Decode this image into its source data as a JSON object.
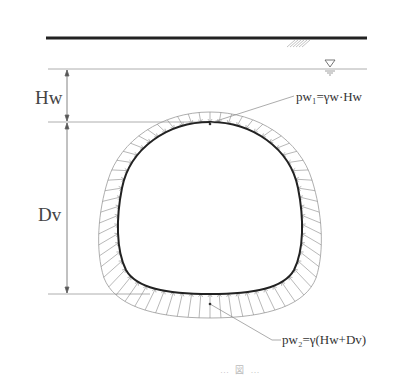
{
  "diagram": {
    "type": "tunnel-water-pressure-distribution",
    "labels": {
      "hw": "Hw",
      "dv": "Dv",
      "pw1": "pw₁=γw·Hw",
      "pw2": "pw₂=γ(Hw+Dv)",
      "footer_faint": "… 図 …"
    },
    "elements": [
      {
        "id": "ground-surface",
        "kind": "thick-line"
      },
      {
        "id": "water-table",
        "kind": "line",
        "symbol": "water-level-triangle"
      },
      {
        "id": "hw-dimension",
        "label_ref": "hw"
      },
      {
        "id": "dv-dimension",
        "label_ref": "dv"
      },
      {
        "id": "tunnel-lining",
        "kind": "closed-curve"
      },
      {
        "id": "pressure-envelope",
        "kind": "closed-curve",
        "note": "radial arrows from envelope to lining, increasing with depth"
      }
    ],
    "colors": {
      "ground": "#222222",
      "lines": "#888888",
      "lining": "#222222",
      "arrows": "#777777",
      "text": "#333333"
    }
  }
}
